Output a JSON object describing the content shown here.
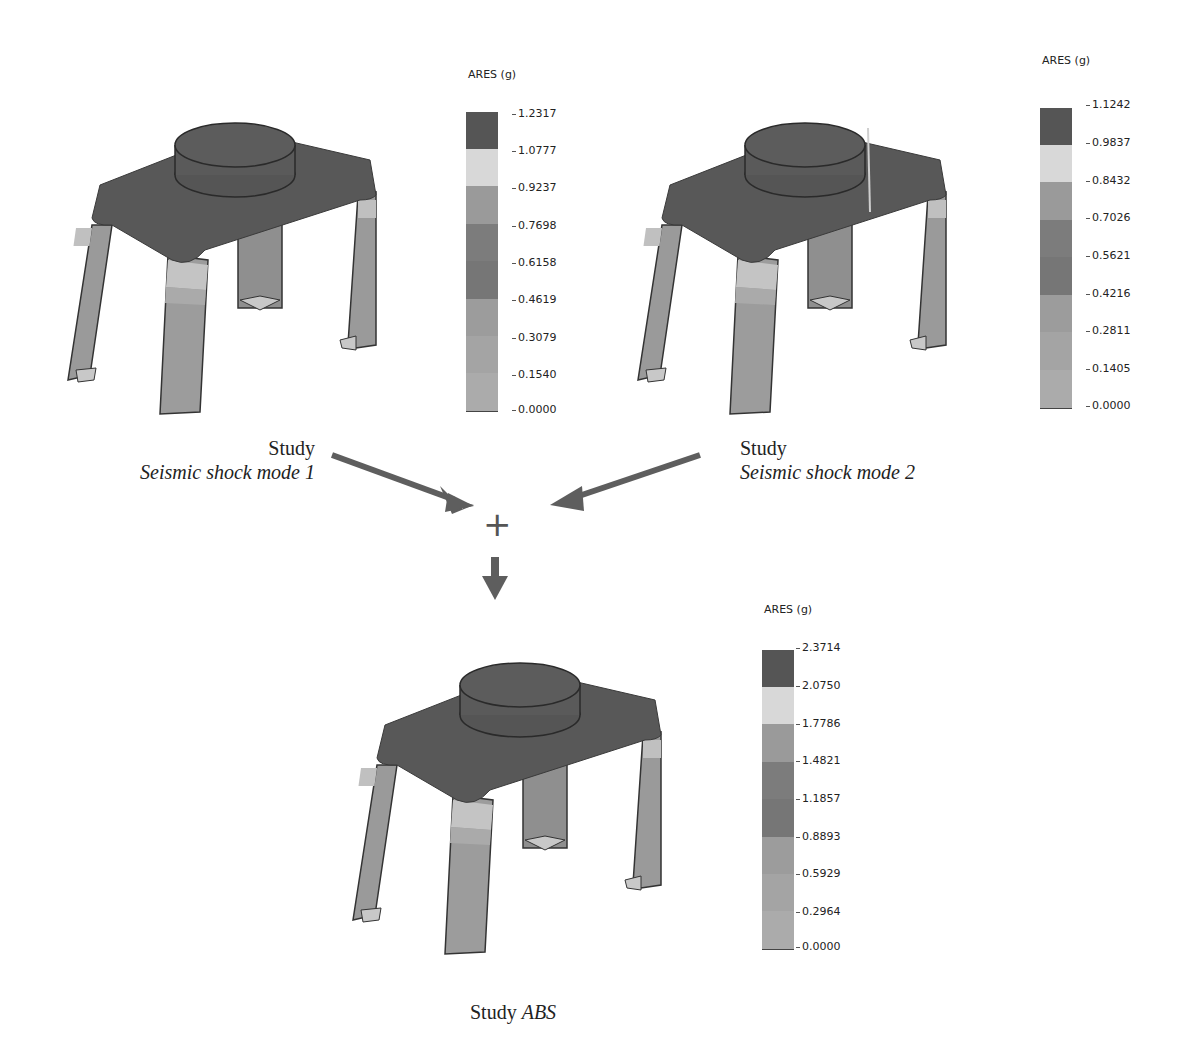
{
  "studies": [
    {
      "caption_prefix": "Study",
      "caption_name": "Seismic shock mode 1",
      "legend": {
        "title": "ARES (g)",
        "ticks": [
          "1.2317",
          "1.0777",
          "0.9237",
          "0.7698",
          "0.6158",
          "0.4619",
          "0.3079",
          "0.1540",
          "0.0000"
        ]
      }
    },
    {
      "caption_prefix": "Study",
      "caption_name": "Seismic shock mode 2",
      "legend": {
        "title": "ARES (g)",
        "ticks": [
          "1.1242",
          "0.9837",
          "0.8432",
          "0.7026",
          "0.5621",
          "0.4216",
          "0.2811",
          "0.1405",
          "0.0000"
        ]
      }
    },
    {
      "caption_prefix": "Study",
      "caption_name": "ABS",
      "legend": {
        "title": "ARES (g)",
        "ticks": [
          "2.3714",
          "2.0750",
          "1.7786",
          "1.4821",
          "1.1857",
          "0.8893",
          "0.5929",
          "0.2964",
          "0.0000"
        ]
      }
    }
  ],
  "operator": "+",
  "band_colors": [
    "#555555",
    "#d8d8d8",
    "#9a9a9a",
    "#7c7c7c",
    "#767676",
    "#9c9c9c",
    "#a4a4a4",
    "#ababab"
  ],
  "colors": {
    "frame_dark": "#585858",
    "leg_mid": "#9a9a9a",
    "leg_light": "#c4c4c4",
    "arrow": "#5e5e5e"
  }
}
